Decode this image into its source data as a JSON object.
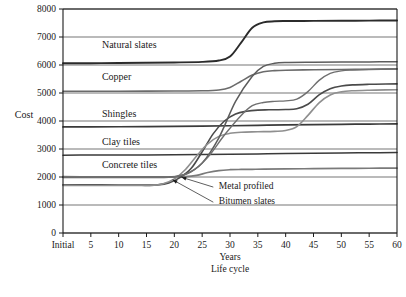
{
  "chart_data": {
    "type": "line",
    "title": "",
    "xlabel": "Years",
    "xlabel2": "Life cycle",
    "ylabel": "Cost",
    "ylim": [
      0,
      8000
    ],
    "ytick_values": [
      0,
      1000,
      2000,
      3000,
      4000,
      5000,
      6000,
      7000,
      8000
    ],
    "ytick_labels": [
      "0",
      "1000",
      "2000",
      "3000",
      "4000",
      "5000",
      "6000",
      "7000",
      "8000"
    ],
    "xlim": [
      0,
      60
    ],
    "xtick_values": [
      0,
      5,
      10,
      15,
      20,
      25,
      30,
      35,
      40,
      45,
      50,
      55,
      60
    ],
    "xtick_labels": [
      "Initial",
      "5",
      "10",
      "15",
      "20",
      "25",
      "30",
      "35",
      "40",
      "45",
      "50",
      "55",
      "60"
    ],
    "grid": "horizontal",
    "legend": "inline-labels",
    "series": [
      {
        "name": "Natural slates",
        "color": "#2b2b2b",
        "width": 1.9,
        "label_x": 7,
        "label_y": 6600,
        "points": [
          [
            0,
            6060
          ],
          [
            5,
            6065
          ],
          [
            10,
            6070
          ],
          [
            15,
            6080
          ],
          [
            20,
            6090
          ],
          [
            25,
            6110
          ],
          [
            28,
            6160
          ],
          [
            30,
            6300
          ],
          [
            32,
            6800
          ],
          [
            34,
            7330
          ],
          [
            36,
            7520
          ],
          [
            38,
            7560
          ],
          [
            40,
            7570
          ],
          [
            45,
            7575
          ],
          [
            50,
            7580
          ],
          [
            55,
            7585
          ],
          [
            60,
            7590
          ]
        ]
      },
      {
        "name": "Copper",
        "color": "#6b6b6b",
        "width": 1.6,
        "label_x": 7,
        "label_y": 5450,
        "points": [
          [
            0,
            5060
          ],
          [
            5,
            5062
          ],
          [
            10,
            5064
          ],
          [
            15,
            5068
          ],
          [
            20,
            5072
          ],
          [
            25,
            5080
          ],
          [
            28,
            5110
          ],
          [
            30,
            5200
          ],
          [
            32,
            5420
          ],
          [
            34,
            5640
          ],
          [
            36,
            5760
          ],
          [
            38,
            5800
          ],
          [
            40,
            5815
          ],
          [
            45,
            5830
          ],
          [
            50,
            5840
          ],
          [
            55,
            5850
          ],
          [
            60,
            5860
          ]
        ]
      },
      {
        "name": "Shingles",
        "color": "#3a3a3a",
        "width": 1.7,
        "label_x": 7,
        "label_y": 4150,
        "points": [
          [
            0,
            3790
          ],
          [
            5,
            3792
          ],
          [
            10,
            3795
          ],
          [
            15,
            3800
          ],
          [
            20,
            3805
          ],
          [
            25,
            3815
          ],
          [
            30,
            3830
          ],
          [
            35,
            3845
          ],
          [
            40,
            3860
          ],
          [
            45,
            3870
          ],
          [
            50,
            3880
          ],
          [
            55,
            3890
          ],
          [
            60,
            3900
          ]
        ]
      },
      {
        "name": "Clay tiles",
        "color": "#3a3a3a",
        "width": 1.5,
        "label_x": 7,
        "label_y": 3130,
        "points": [
          [
            0,
            2780
          ],
          [
            5,
            2782
          ],
          [
            10,
            2784
          ],
          [
            15,
            2788
          ],
          [
            20,
            2792
          ],
          [
            25,
            2800
          ],
          [
            30,
            2812
          ],
          [
            35,
            2825
          ],
          [
            40,
            2838
          ],
          [
            45,
            2848
          ],
          [
            50,
            2858
          ],
          [
            55,
            2866
          ],
          [
            60,
            2875
          ]
        ]
      },
      {
        "name": "Concrete tiles",
        "color": "#7a7a7a",
        "width": 1.7,
        "label_x": 7,
        "label_y": 2330,
        "points": [
          [
            0,
            2010
          ],
          [
            5,
            2008
          ],
          [
            10,
            2006
          ],
          [
            15,
            2004
          ],
          [
            18,
            2002
          ],
          [
            20,
            2000
          ],
          [
            22,
            2010
          ],
          [
            24,
            2060
          ],
          [
            26,
            2160
          ],
          [
            28,
            2230
          ],
          [
            30,
            2260
          ],
          [
            32,
            2270
          ],
          [
            34,
            2275
          ],
          [
            36,
            2280
          ],
          [
            40,
            2290
          ],
          [
            45,
            2298
          ],
          [
            50,
            2305
          ],
          [
            55,
            2312
          ],
          [
            60,
            2320
          ]
        ]
      },
      {
        "name": "Metal profiled",
        "color": "#4a4a4a",
        "width": 1.6,
        "annotation": true,
        "annot_x": 28,
        "annot_y": 1560,
        "arrow_from": [
          27.0,
          1640
        ],
        "arrow_to": [
          21.3,
          1990
        ],
        "points": [
          [
            0,
            1720
          ],
          [
            5,
            1718
          ],
          [
            10,
            1716
          ],
          [
            12,
            1715
          ],
          [
            15,
            1715
          ],
          [
            17,
            1720
          ],
          [
            19,
            1790
          ],
          [
            21,
            1980
          ],
          [
            23,
            2300
          ],
          [
            25,
            2900
          ],
          [
            27,
            3550
          ],
          [
            29,
            4000
          ],
          [
            31,
            4250
          ],
          [
            33,
            4350
          ],
          [
            35,
            4390
          ],
          [
            37,
            4400
          ],
          [
            40,
            4410
          ],
          [
            42,
            4440
          ],
          [
            44,
            4600
          ],
          [
            46,
            4930
          ],
          [
            48,
            5150
          ],
          [
            50,
            5250
          ],
          [
            52,
            5290
          ],
          [
            55,
            5310
          ],
          [
            58,
            5320
          ],
          [
            60,
            5325
          ]
        ]
      },
      {
        "name": "Bitumen slates",
        "color": "#8f8f8f",
        "width": 1.6,
        "annotation": true,
        "annot_x": 28,
        "annot_y": 1020,
        "arrow_from": [
          27.0,
          1100
        ],
        "arrow_to": [
          19.7,
          1900
        ],
        "points": [
          [
            0,
            1700
          ],
          [
            5,
            1698
          ],
          [
            10,
            1696
          ],
          [
            14,
            1694
          ],
          [
            16,
            1700
          ],
          [
            18,
            1760
          ],
          [
            20,
            1930
          ],
          [
            22,
            2270
          ],
          [
            24,
            2750
          ],
          [
            26,
            3180
          ],
          [
            28,
            3450
          ],
          [
            30,
            3560
          ],
          [
            32,
            3600
          ],
          [
            35,
            3615
          ],
          [
            38,
            3630
          ],
          [
            40,
            3660
          ],
          [
            42,
            3800
          ],
          [
            44,
            4200
          ],
          [
            46,
            4650
          ],
          [
            48,
            4930
          ],
          [
            50,
            5040
          ],
          [
            52,
            5080
          ],
          [
            55,
            5100
          ],
          [
            58,
            5110
          ],
          [
            60,
            5115
          ]
        ]
      },
      {
        "name": "Rising mid curve",
        "color": "#5c5c5c",
        "width": 1.5,
        "hidden_label": true,
        "points": [
          [
            0,
            1985
          ],
          [
            10,
            1982
          ],
          [
            16,
            1980
          ],
          [
            19,
            1995
          ],
          [
            22,
            2100
          ],
          [
            25,
            2500
          ],
          [
            28,
            3400
          ],
          [
            31,
            4700
          ],
          [
            34,
            5600
          ],
          [
            36,
            5950
          ],
          [
            38,
            6060
          ],
          [
            40,
            6090
          ],
          [
            45,
            6100
          ],
          [
            50,
            6105
          ],
          [
            55,
            6110
          ],
          [
            60,
            6115
          ]
        ]
      },
      {
        "name": "Upper mid curve",
        "color": "#6f6f6f",
        "width": 1.4,
        "hidden_label": true,
        "points": [
          [
            0,
            1995
          ],
          [
            12,
            1992
          ],
          [
            17,
            1990
          ],
          [
            20,
            2010
          ],
          [
            23,
            2180
          ],
          [
            26,
            2700
          ],
          [
            29,
            3500
          ],
          [
            32,
            4200
          ],
          [
            34,
            4550
          ],
          [
            36,
            4660
          ],
          [
            38,
            4700
          ],
          [
            40,
            4720
          ],
          [
            42,
            4780
          ],
          [
            44,
            5050
          ],
          [
            46,
            5450
          ],
          [
            48,
            5700
          ],
          [
            50,
            5790
          ],
          [
            52,
            5820
          ],
          [
            55,
            5840
          ],
          [
            60,
            5855
          ]
        ]
      }
    ],
    "inline_labels": [
      {
        "text": "Natural slates",
        "x": 7,
        "y": 6600
      },
      {
        "text": "Copper",
        "x": 7,
        "y": 5450
      },
      {
        "text": "Shingles",
        "x": 7,
        "y": 4150
      },
      {
        "text": "Clay tiles",
        "x": 7,
        "y": 3130
      },
      {
        "text": "Concrete tiles",
        "x": 7,
        "y": 2330
      }
    ],
    "annotations": [
      {
        "text": "Metal profiled",
        "x": 28,
        "y": 1560
      },
      {
        "text": "Bitumen slates",
        "x": 28,
        "y": 1020
      }
    ]
  }
}
